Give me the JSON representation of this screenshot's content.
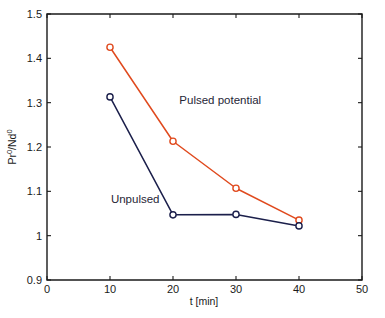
{
  "chart_data": {
    "type": "line",
    "title": "",
    "xlabel": "t [min]",
    "ylabel": "Pr0/Nd0",
    "ylabel_base": "Pr",
    "ylabel_sup1": "0",
    "ylabel_mid": "/Nd",
    "ylabel_sup2": "0",
    "xlim": [
      0,
      50
    ],
    "ylim": [
      0.9,
      1.5
    ],
    "xticks": [
      "0",
      "10",
      "20",
      "30",
      "40",
      "50"
    ],
    "xtick_values": [
      0,
      10,
      20,
      30,
      40,
      50
    ],
    "yticks": [
      "0.9",
      "1",
      "1.1",
      "1.2",
      "1.3",
      "1.4",
      "1.5"
    ],
    "ytick_values": [
      0.9,
      1.0,
      1.1,
      1.2,
      1.3,
      1.4,
      1.5
    ],
    "grid": false,
    "legend_position": "inline-annotations",
    "x": [
      10,
      20,
      30,
      40
    ],
    "series": [
      {
        "name": "Pulsed potential",
        "color": "#E04A1E",
        "values": [
          1.425,
          1.213,
          1.107,
          1.035
        ]
      },
      {
        "name": "Unpulsed",
        "color": "#1B1F4B",
        "values": [
          1.313,
          1.047,
          1.048,
          1.022
        ]
      }
    ],
    "annotations": [
      {
        "text": "Pulsed potential",
        "x": 27.5,
        "y": 1.298,
        "color": "#262636"
      },
      {
        "text": "Unpulsed",
        "x": 14.0,
        "y": 1.074,
        "color": "#262636"
      }
    ]
  },
  "figure": {
    "background_color": "#ffffff",
    "axis_color": "#1a1a1a",
    "top_clipped_caption": ""
  }
}
